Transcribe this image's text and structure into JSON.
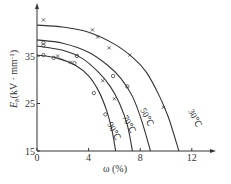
{
  "chart_data": {
    "type": "line",
    "title": "",
    "xlabel": "ω (%)",
    "ylabel": "E_b(kV · mm⁻¹)",
    "xlim": [
      0,
      13.5
    ],
    "ylim": [
      15,
      46
    ],
    "x_ticks": [
      0,
      4,
      8,
      12
    ],
    "y_ticks": [
      15,
      25,
      35
    ],
    "grid": false,
    "legend": "inline curve labels",
    "series": [
      {
        "name": "30℃",
        "marker": "x",
        "curve": [
          [
            0,
            41.5
          ],
          [
            2,
            41.1
          ],
          [
            4,
            40.0
          ],
          [
            6,
            37.5
          ],
          [
            7.5,
            34.5
          ],
          [
            8.5,
            31.5
          ],
          [
            9.5,
            26.5
          ],
          [
            10.2,
            22
          ],
          [
            11.0,
            15
          ]
        ],
        "points": [
          [
            0.5,
            42.6
          ],
          [
            4.3,
            40.5
          ],
          [
            4.7,
            39.0
          ],
          [
            5.6,
            36.7
          ],
          [
            7.2,
            35.2
          ],
          [
            9.8,
            24.2
          ]
        ]
      },
      {
        "name": "50℃",
        "marker": "o",
        "curve": [
          [
            0,
            38.4
          ],
          [
            2,
            37.7
          ],
          [
            4,
            35.8
          ],
          [
            5.5,
            33.0
          ],
          [
            6.5,
            30.3
          ],
          [
            7.4,
            26.5
          ],
          [
            8.1,
            21.5
          ],
          [
            8.8,
            15
          ]
        ],
        "points": [
          [
            0.5,
            37.8
          ],
          [
            0.5,
            37.2
          ],
          [
            3.1,
            35.0
          ],
          [
            5.9,
            30.8
          ],
          [
            7.0,
            28.6
          ]
        ]
      },
      {
        "name": "70℃",
        "marker": "x",
        "curve": [
          [
            0,
            37.1
          ],
          [
            2,
            36.2
          ],
          [
            3.5,
            34.5
          ],
          [
            4.8,
            31.5
          ],
          [
            5.7,
            28.5
          ],
          [
            6.4,
            25
          ],
          [
            7.0,
            20.5
          ],
          [
            7.4,
            15
          ]
        ],
        "points": [
          [
            1.6,
            35.0
          ],
          [
            2.6,
            33.7
          ],
          [
            5.1,
            29.8
          ],
          [
            6.0,
            26.0
          ]
        ]
      },
      {
        "name": "90℃",
        "marker": "o",
        "curve": [
          [
            0,
            35.2
          ],
          [
            1.5,
            34.6
          ],
          [
            3,
            33.0
          ],
          [
            4.0,
            30.8
          ],
          [
            4.8,
            27.5
          ],
          [
            5.4,
            23.5
          ],
          [
            5.8,
            19.5
          ],
          [
            6.1,
            15
          ]
        ],
        "points": [
          [
            0.5,
            35.2
          ],
          [
            1.3,
            34.6
          ],
          [
            2.9,
            33.5
          ],
          [
            4.4,
            27.2
          ],
          [
            5.3,
            22.7
          ]
        ]
      }
    ]
  },
  "axes": {
    "x_label": "ω (%)",
    "y_label_main": "E",
    "y_label_sub": "b",
    "y_label_rest": "(kV · mm",
    "y_label_sup": "-1",
    "y_label_close": ")",
    "x_ticks": [
      "0",
      "4",
      "8",
      "12"
    ],
    "y_ticks": [
      "15",
      "25",
      "35"
    ]
  },
  "curve_labels": [
    "30℃",
    "50℃",
    "70℃",
    "90℃"
  ]
}
